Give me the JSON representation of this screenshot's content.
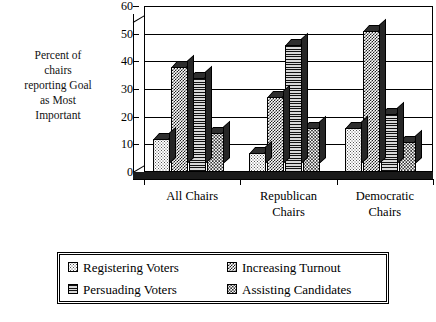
{
  "axis_title_y_lines": [
    "Percent of",
    "chairs",
    "reporting Goal",
    "as Most",
    "Important"
  ],
  "chart_data": {
    "type": "bar",
    "title": "",
    "subtitle": "",
    "xlabel": "",
    "ylabel": "Percent of chairs reporting Goal as Most Important",
    "ylim": [
      0,
      60
    ],
    "yticks": [
      0,
      10,
      20,
      30,
      40,
      50,
      60
    ],
    "ytick_labels": [
      "0",
      "10",
      "20",
      "30",
      "40",
      "50",
      "60"
    ],
    "grid": true,
    "grouped": true,
    "style_3d": true,
    "legend_position": "bottom",
    "categories": [
      "All Chairs",
      "Republican Chairs",
      "Democratic Chairs"
    ],
    "category_label_lines": [
      [
        "All Chairs"
      ],
      [
        "Republican",
        "Chairs"
      ],
      [
        "Democratic",
        "Chairs"
      ]
    ],
    "series": [
      {
        "name": "Registering Voters",
        "pattern": "dots-light",
        "values": [
          12,
          7,
          16
        ]
      },
      {
        "name": "Increasing Turnout",
        "pattern": "checker-dark",
        "values": [
          38,
          27,
          51
        ]
      },
      {
        "name": "Persuading Voters",
        "pattern": "horizontal-lines",
        "values": [
          34,
          46,
          21
        ]
      },
      {
        "name": "Assisting Candidates",
        "pattern": "dots-mid",
        "values": [
          14,
          16,
          11
        ]
      }
    ]
  },
  "legend": {
    "items": [
      {
        "label": "Registering Voters",
        "pattern": "dots-light"
      },
      {
        "label": "Increasing Turnout",
        "pattern": "checker-dark"
      },
      {
        "label": "Persuading Voters",
        "pattern": "horizontal-lines"
      },
      {
        "label": "Assisting Candidates",
        "pattern": "dots-mid"
      }
    ]
  },
  "colors": {
    "background": "#ffffff",
    "foreground": "#000000",
    "floor": "#1a1a1a",
    "bar_top": "#2e2e2e",
    "bar_side": "#262626"
  }
}
